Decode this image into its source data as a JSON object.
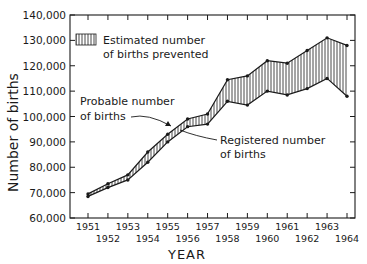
{
  "chart_data": {
    "type": "area",
    "title": "",
    "xlabel": "YEAR",
    "ylabel": "Number of births",
    "x": [
      1951,
      1952,
      1953,
      1954,
      1955,
      1956,
      1957,
      1958,
      1959,
      1960,
      1961,
      1962,
      1963,
      1964
    ],
    "series": [
      {
        "name": "Probable number of births",
        "values": [
          69500,
          73500,
          77000,
          86000,
          93000,
          99000,
          101000,
          114500,
          116000,
          122000,
          121000,
          126000,
          131000,
          128000
        ]
      },
      {
        "name": "Registered number of births",
        "values": [
          68500,
          72000,
          75000,
          82000,
          90000,
          96000,
          97000,
          106000,
          104500,
          110000,
          108500,
          111000,
          115000,
          108000
        ]
      }
    ],
    "filled_region": "Estimated number of births prevented",
    "ylim": [
      60000,
      140000
    ],
    "yticks": [
      60000,
      70000,
      80000,
      90000,
      100000,
      110000,
      120000,
      130000,
      140000
    ],
    "ytick_labels": [
      "60,000",
      "70,000",
      "80,000",
      "90,000",
      "100,000",
      "110,000",
      "120,000",
      "130,000",
      "140,000"
    ],
    "xtick_labels": [
      "1951",
      "1952",
      "1953",
      "1954",
      "1955",
      "1956",
      "1957",
      "1958",
      "1959",
      "1960",
      "1961",
      "1962",
      "1963",
      "1964"
    ],
    "grid": false,
    "legend": {
      "position": "upper-left",
      "entries": [
        "Estimated number of births prevented"
      ]
    },
    "annotations": [
      "Probable number of births",
      "Registered number of births"
    ]
  },
  "legend": {
    "line1": "Estimated number",
    "line2": "of births prevented"
  },
  "annotations": {
    "probable_line1": "Probable number",
    "probable_line2": "of births",
    "registered_line1": "Registered number",
    "registered_line2": "of births"
  },
  "axes": {
    "xlabel": "YEAR",
    "ylabel": "Number of births"
  }
}
